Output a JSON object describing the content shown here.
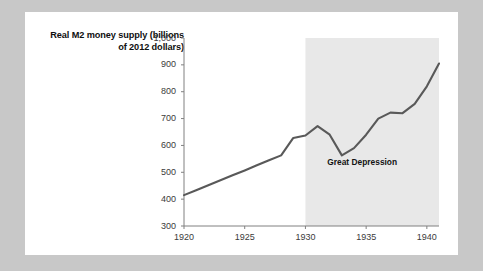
{
  "chart_data": {
    "type": "line",
    "title": "",
    "ylabel": "Real M2 money supply (billions of 2012 dollars)",
    "xlabel": "",
    "xlim": [
      1920,
      1941
    ],
    "ylim": [
      300,
      1000
    ],
    "grid": false,
    "legend": null,
    "y_ticks": [
      "300",
      "400",
      "500",
      "600",
      "700",
      "800",
      "900",
      "1,000"
    ],
    "y_tick_values": [
      300,
      400,
      500,
      600,
      700,
      800,
      900,
      1000
    ],
    "x_ticks": [
      "1920",
      "1925",
      "1930",
      "1935",
      "1940"
    ],
    "x_tick_values": [
      1920,
      1925,
      1930,
      1935,
      1940
    ],
    "line_color": "#595959",
    "shading_color": "#e8e8e8",
    "x": [
      1920,
      1921,
      1922,
      1923,
      1924,
      1925,
      1926,
      1927,
      1928,
      1929,
      1930,
      1931,
      1932,
      1933,
      1934,
      1935,
      1936,
      1937,
      1938,
      1939,
      1940,
      1941
    ],
    "values": [
      415,
      433,
      452,
      470,
      489,
      507,
      526,
      545,
      563,
      628,
      637,
      672,
      640,
      563,
      590,
      640,
      700,
      722,
      720,
      755,
      820,
      905
    ],
    "series": [
      {
        "name": "Real M2 money supply",
        "values": [
          415,
          433,
          452,
          470,
          489,
          507,
          526,
          545,
          563,
          628,
          637,
          672,
          640,
          563,
          590,
          640,
          700,
          722,
          720,
          755,
          820,
          905
        ]
      }
    ],
    "annotations": [
      {
        "text": "Great Depression",
        "x": 1934.6,
        "y": 540
      }
    ],
    "shaded_regions": [
      {
        "label": "Great Depression",
        "x_start": 1930,
        "x_end": 1941
      }
    ]
  }
}
